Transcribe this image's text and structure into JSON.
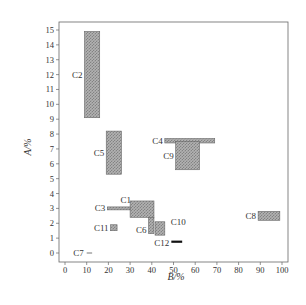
{
  "chart_data": {
    "type": "scatter",
    "subtype": "range-rectangles",
    "title": "",
    "xlabel": "B/%",
    "ylabel": "A/%",
    "xlim": [
      0,
      100
    ],
    "ylim": [
      0,
      15
    ],
    "xticks": [
      0,
      10,
      20,
      30,
      40,
      50,
      60,
      70,
      80,
      90,
      100
    ],
    "yticks": [
      0,
      1,
      2,
      3,
      4,
      5,
      6,
      7,
      8,
      9,
      10,
      11,
      12,
      13,
      14,
      15
    ],
    "grid": false,
    "legend": null,
    "fill_style": "hatched-gray",
    "series": [
      {
        "name": "C1",
        "x": [
          30,
          41
        ],
        "y": [
          2.4,
          3.5
        ],
        "label_pos": "left-top"
      },
      {
        "name": "C2",
        "x": [
          9,
          16
        ],
        "y": [
          9.1,
          14.9
        ],
        "label_pos": "left"
      },
      {
        "name": "C3",
        "x": [
          19.5,
          30
        ],
        "y": [
          2.9,
          3.1
        ],
        "label_pos": "left"
      },
      {
        "name": "C4",
        "x": [
          46,
          69
        ],
        "y": [
          7.4,
          7.7
        ],
        "label_pos": "left"
      },
      {
        "name": "C5",
        "x": [
          19,
          26
        ],
        "y": [
          5.3,
          8.2
        ],
        "label_pos": "left"
      },
      {
        "name": "C6",
        "x": [
          38.5,
          41
        ],
        "y": [
          1.3,
          2.4
        ],
        "label_pos": "left"
      },
      {
        "name": "C7",
        "x": [
          10,
          12.5
        ],
        "y": [
          0,
          0
        ],
        "label_pos": "left"
      },
      {
        "name": "C8",
        "x": [
          89,
          99
        ],
        "y": [
          2.2,
          2.8
        ],
        "label_pos": "left"
      },
      {
        "name": "C9",
        "x": [
          51,
          62
        ],
        "y": [
          5.6,
          7.5
        ],
        "label_pos": "left"
      },
      {
        "name": "C10",
        "x": [
          41.5,
          46
        ],
        "y": [
          1.2,
          2.1
        ],
        "label_pos": "right"
      },
      {
        "name": "C11",
        "x": [
          21,
          24
        ],
        "y": [
          1.5,
          1.9
        ],
        "label_pos": "left"
      },
      {
        "name": "C12",
        "x": [
          49,
          54
        ],
        "y": [
          0.7,
          0.8
        ],
        "label_pos": "left"
      }
    ]
  },
  "colors": {
    "fill": "#9a9a9a",
    "fill_light": "#c4c4c4",
    "stroke": "#555555",
    "axis": "#666666",
    "line_black": "#111111"
  }
}
